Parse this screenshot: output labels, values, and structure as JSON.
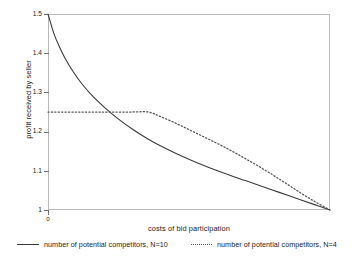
{
  "chart_data": {
    "type": "line",
    "title": "",
    "xlabel": "costs of bid participation",
    "ylabel": "profit received by seller",
    "xlim": [
      0,
      1
    ],
    "ylim": [
      1,
      1.5
    ],
    "grid": false,
    "legend_position": "below",
    "yticklabels": [
      "1.5",
      "1.4",
      "1.3",
      "1.2",
      "1.1",
      "1"
    ],
    "yticks": [
      1.5,
      1.4,
      1.3,
      1.2,
      1.1,
      1.0
    ],
    "xticklabels": [
      "0"
    ],
    "xticks": [
      0
    ],
    "series": [
      {
        "name": "number of potential competitors, N=10",
        "style": "solid",
        "color": "#3a3a3a",
        "x": [
          0.0,
          0.02,
          0.04,
          0.06,
          0.09,
          0.12,
          0.16,
          0.2,
          0.25,
          0.3,
          0.35,
          0.4,
          0.46,
          0.52,
          0.58,
          0.64,
          0.7,
          0.76,
          0.82,
          0.88,
          0.94,
          1.0
        ],
        "y": [
          1.5,
          1.452,
          1.417,
          1.388,
          1.352,
          1.322,
          1.289,
          1.262,
          1.232,
          1.206,
          1.183,
          1.163,
          1.142,
          1.123,
          1.106,
          1.09,
          1.075,
          1.06,
          1.045,
          1.03,
          1.015,
          1.0
        ]
      },
      {
        "name": "number of potential competitors, N=4",
        "style": "dotted",
        "color": "#555555",
        "x": [
          0.0,
          0.1,
          0.2,
          0.3,
          0.355,
          0.4,
          0.46,
          0.52,
          0.58,
          0.64,
          0.7,
          0.76,
          0.82,
          0.88,
          0.94,
          1.0
        ],
        "y": [
          1.25,
          1.25,
          1.25,
          1.25,
          1.25,
          1.238,
          1.219,
          1.198,
          1.177,
          1.155,
          1.131,
          1.106,
          1.079,
          1.051,
          1.024,
          1.0
        ]
      }
    ],
    "annotations": {
      "crossing_point_x": 0.3,
      "crossing_point_y": 1.25,
      "dotted_flat_until_x": 0.355
    }
  },
  "legend": {
    "entries": [
      {
        "label": "number of potential competitors, N=10",
        "style": "solid"
      },
      {
        "label": "number of potential competitors, N=4",
        "style": "dotted"
      }
    ]
  }
}
